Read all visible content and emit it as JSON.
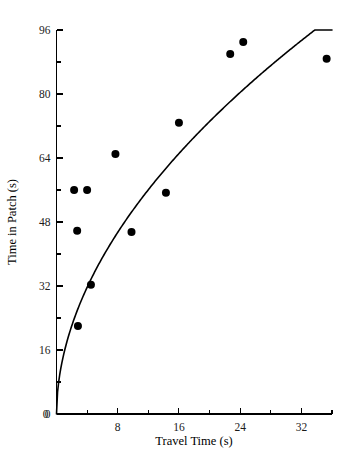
{
  "chart_data": {
    "type": "scatter",
    "title": "",
    "xlabel": "Travel Time (s)",
    "ylabel": "Time in Patch (s)",
    "xlim": [
      0,
      36
    ],
    "ylim": [
      0,
      96
    ],
    "grid": false,
    "legend": null,
    "x_ticks_major": [
      0,
      8,
      16,
      24,
      32
    ],
    "x_ticks_major_labels": [
      "0",
      "8",
      "16",
      "24",
      "32"
    ],
    "x_ticks_minor": [
      4,
      12,
      20,
      28,
      36
    ],
    "y_ticks_major": [
      0,
      16,
      32,
      48,
      64,
      80,
      96
    ],
    "y_ticks_major_labels": [
      "0",
      "16",
      "32",
      "48",
      "64",
      "80",
      "96"
    ],
    "y_ticks_minor": [
      8,
      24,
      40,
      56,
      72,
      88
    ],
    "points": [
      {
        "x": 2.3,
        "y": 56.0
      },
      {
        "x": 4.0,
        "y": 56.0
      },
      {
        "x": 2.7,
        "y": 45.8
      },
      {
        "x": 4.5,
        "y": 32.3
      },
      {
        "x": 2.8,
        "y": 22.0
      },
      {
        "x": 7.7,
        "y": 65.0
      },
      {
        "x": 9.8,
        "y": 45.5
      },
      {
        "x": 14.3,
        "y": 55.3
      },
      {
        "x": 16.0,
        "y": 72.8
      },
      {
        "x": 22.7,
        "y": 90.0
      },
      {
        "x": 24.4,
        "y": 93.0
      },
      {
        "x": 35.3,
        "y": 88.8
      }
    ],
    "marker_size_px": 4.0,
    "marker_color": "#000000",
    "curve": {
      "label": "fitted curve",
      "color": "#000000",
      "description": "increasing concave power/saturating curve through origin",
      "exponent": 0.52,
      "coefficient": 15.4,
      "x_range": [
        0.0,
        36.0
      ]
    }
  },
  "axes": {
    "x_title": "Travel Time (s)",
    "y_title": "Time in Patch (s)"
  }
}
